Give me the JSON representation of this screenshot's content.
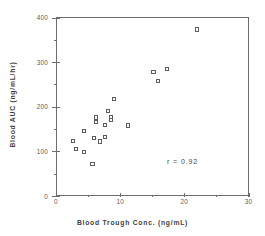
{
  "chart_data": {
    "type": "scatter",
    "title": "",
    "xlabel": "Blood Trough Conc.  (ng/mL)",
    "ylabel": "Blood  AUC  (ng/mL/hr)",
    "xlim": [
      0,
      30
    ],
    "ylim": [
      0,
      400
    ],
    "xticks": [
      0,
      10,
      20,
      30
    ],
    "yticks": [
      0,
      100,
      200,
      300,
      400
    ],
    "xminorticks": [
      5,
      15,
      25
    ],
    "yminorticks": [
      50,
      150,
      250,
      350
    ],
    "grid": false,
    "legend": null,
    "marker": "open-square",
    "annotations": [
      {
        "text": "r = 0.92",
        "x": 17.2,
        "y": 75
      }
    ],
    "points": [
      {
        "x": 2.6,
        "y": 124
      },
      {
        "x": 3.1,
        "y": 106
      },
      {
        "x": 4.4,
        "y": 98
      },
      {
        "x": 4.4,
        "y": 146
      },
      {
        "x": 5.7,
        "y": 72
      },
      {
        "x": 5.9,
        "y": 130
      },
      {
        "x": 6.2,
        "y": 176
      },
      {
        "x": 6.2,
        "y": 165
      },
      {
        "x": 6.9,
        "y": 122
      },
      {
        "x": 7.6,
        "y": 132
      },
      {
        "x": 7.6,
        "y": 160
      },
      {
        "x": 8.1,
        "y": 190
      },
      {
        "x": 8.6,
        "y": 176
      },
      {
        "x": 8.6,
        "y": 170
      },
      {
        "x": 9.0,
        "y": 218
      },
      {
        "x": 11.2,
        "y": 158
      },
      {
        "x": 15.2,
        "y": 277
      },
      {
        "x": 15.9,
        "y": 257
      },
      {
        "x": 17.3,
        "y": 284
      },
      {
        "x": 22.0,
        "y": 373
      }
    ]
  },
  "axis": {
    "x_tick_labels": [
      "0",
      "10",
      "20",
      "30"
    ],
    "y_tick_labels": [
      "0",
      "100",
      "200",
      "300",
      "400"
    ]
  }
}
